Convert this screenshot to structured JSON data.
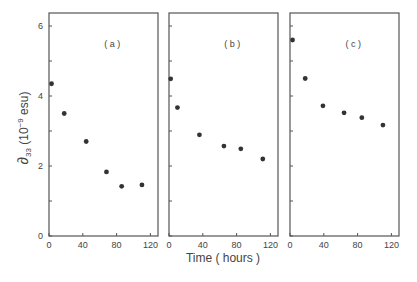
{
  "chart_data": {
    "type": "scatter",
    "title": "",
    "ylabel": "∂33 (10^-9 esu)",
    "ylabel_parts": {
      "symbol": "∂",
      "sub": "33",
      "pre": " (10",
      "sup": "−9",
      "post": " esu)"
    },
    "xlabel": "Time ( hours )",
    "ylim": [
      0,
      6.5
    ],
    "yticks": [
      0,
      2,
      4,
      6
    ],
    "yminor": [
      1,
      3,
      5
    ],
    "xlim": [
      0,
      130
    ],
    "xticks": [
      0,
      40,
      80,
      120
    ],
    "grid": false,
    "legend": null,
    "panels": [
      {
        "label": "( a )",
        "x": [
          3,
          18,
          44,
          68,
          86,
          110
        ],
        "y": [
          4.35,
          3.5,
          2.7,
          1.83,
          1.42,
          1.46
        ]
      },
      {
        "label": "( b )",
        "x": [
          2,
          10,
          36,
          65,
          85,
          111
        ],
        "y": [
          4.49,
          3.67,
          2.89,
          2.57,
          2.49,
          2.2
        ]
      },
      {
        "label": "( c )",
        "x": [
          3,
          18,
          39,
          64,
          85,
          110
        ],
        "y": [
          5.6,
          4.5,
          3.72,
          3.52,
          3.38,
          3.17
        ]
      }
    ]
  }
}
